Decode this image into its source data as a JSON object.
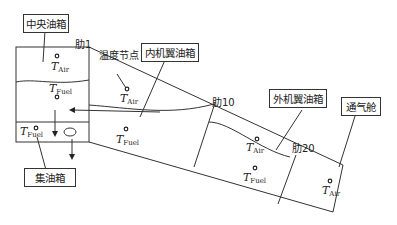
{
  "labels": {
    "central_tank": "中央油箱",
    "inner_wing_tank": "内机翼油箱",
    "outer_wing_tank": "外机翼油箱",
    "vent_tank": "通气舱",
    "collector_tank": "集油箱",
    "temp_node": "温度节点"
  },
  "ribs": {
    "rib1": "肋1",
    "rib10": "肋10",
    "rib20": "肋20"
  },
  "nodes": {
    "t_var": "T",
    "air_sub": "Air",
    "fuel_sub": "Fuel"
  },
  "colors": {
    "line": "#333333",
    "text": "#222222",
    "background": "#ffffff"
  }
}
